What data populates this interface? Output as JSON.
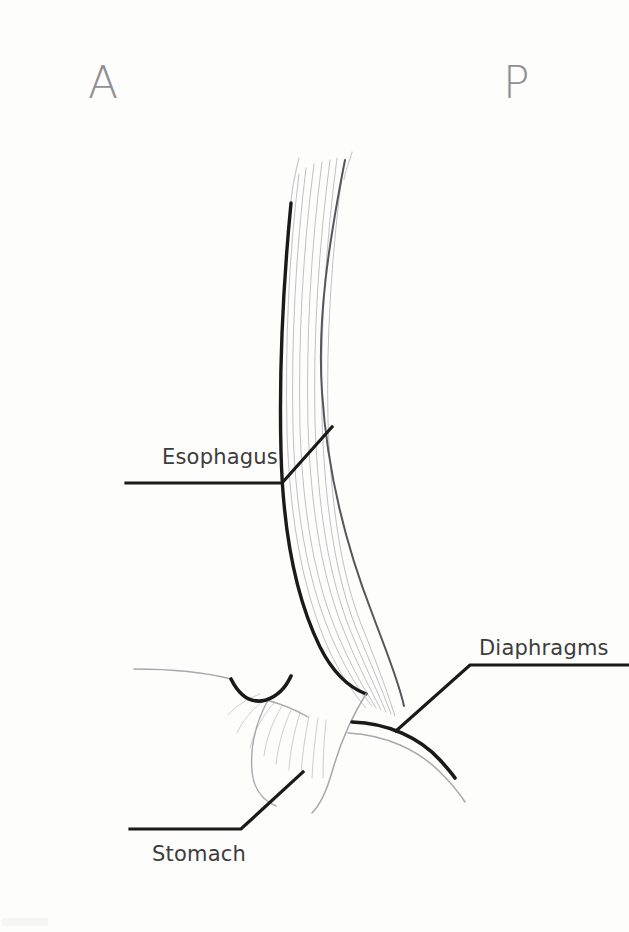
{
  "figure": {
    "medium": "pencil and ink line drawing",
    "background_color": "#fdfdfc",
    "width": 629,
    "height": 932
  },
  "orientation_marks": [
    {
      "id": "anterior",
      "letter": "A",
      "x": 88,
      "y": 98,
      "color": "#8f8f93"
    },
    {
      "id": "posterior",
      "letter": "P",
      "x": 503,
      "y": 98,
      "color": "#8f8f93"
    }
  ],
  "labels": [
    {
      "id": "esophagus",
      "text": "Esophagus",
      "text_x": 162,
      "text_y": 464,
      "text_color": "#3c3c3c",
      "leader_points": "126,483 282,483 332,427",
      "anchor_side": "right"
    },
    {
      "id": "diaphragms",
      "text": "Diaphragms",
      "text_x": 479,
      "text_y": 655,
      "text_color": "#3c3c3c",
      "leader_points": "396,731 470,665 628,665",
      "anchor_side": "left"
    },
    {
      "id": "stomach",
      "text": "Stomach",
      "text_x": 152,
      "text_y": 861,
      "text_color": "#3c3c3c",
      "leader_points": "130,829 241,829 303,772",
      "anchor_side": "right"
    }
  ],
  "structures": [
    {
      "id": "esophagus-anterior-wall",
      "name": "esophagus anterior wall",
      "emphasis": "bold",
      "color": "#1a1a1a",
      "stroke_width": 3.4,
      "path": "M 291 203 C 283 286 279 372 281 452 C 283 533 295 596 320 647 C 333 673 348 687 366 694"
    },
    {
      "id": "esophagus-posterior-wall",
      "name": "esophagus posterior wall",
      "emphasis": "mid",
      "color": "#55555a",
      "stroke_width": 2.0,
      "path": "M 345 160 C 329 242 317 318 322 392 C 327 470 346 546 372 613 C 386 651 398 679 404 706"
    },
    {
      "id": "stomach-cardia-outline",
      "name": "stomach cardia outline",
      "emphasis": "faint",
      "color": "#a8a8ae",
      "stroke_width": 1.5,
      "path": "M 366 694 C 352 716 340 744 332 772 C 326 793 320 805 312 813"
    },
    {
      "id": "stomach-fundus-curve",
      "name": "stomach greater curvature",
      "emphasis": "faint",
      "color": "#b4b4ba",
      "stroke_width": 1.4,
      "path": "M 268 700 C 256 722 250 748 252 772 C 254 790 262 800 276 806"
    }
  ],
  "diaphragm_crura": [
    {
      "id": "left-crus-bold",
      "name": "left diaphragm crus",
      "emphasis": "bold",
      "color": "#1a1a1a",
      "stroke_width": 3.6,
      "path": "M 231 679 C 240 697 252 704 266 700 C 278 696 286 687 291 676"
    },
    {
      "id": "left-crus-faint",
      "name": "left diaphragm membrane",
      "emphasis": "faint",
      "color": "#a8a8ae",
      "stroke_width": 1.5,
      "path": "M 134 669 C 172 669 208 673 231 679"
    },
    {
      "id": "left-crus-under",
      "name": "left diaphragm lower leaflet",
      "emphasis": "faint",
      "color": "#b0b0b6",
      "stroke_width": 1.4,
      "path": "M 266 700 C 282 704 296 710 308 717"
    },
    {
      "id": "right-crus-bold",
      "name": "right diaphragm crus",
      "emphasis": "bold",
      "color": "#1a1a1a",
      "stroke_width": 3.6,
      "path": "M 352 722 C 388 723 420 738 440 760 C 449 770 453 775 455 778"
    },
    {
      "id": "right-crus-faint",
      "name": "right diaphragm membrane",
      "emphasis": "faint",
      "color": "#a8a8ae",
      "stroke_width": 1.5,
      "path": "M 348 733 C 386 735 418 750 440 772 C 452 784 460 794 465 802"
    }
  ],
  "esophagus_striations": {
    "name": "longitudinal muscle fibers",
    "color": "#b9b9c0",
    "count": 7
  },
  "gastric_rugae": {
    "name": "gastric mucosal folds",
    "color": "#c5c5cc",
    "count": 9
  }
}
